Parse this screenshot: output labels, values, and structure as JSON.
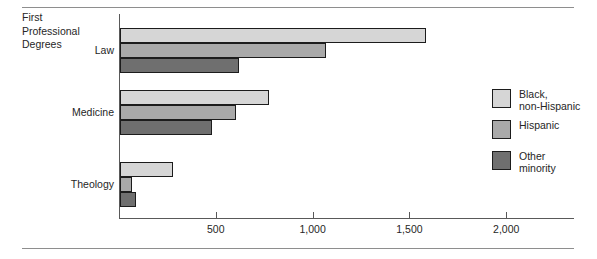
{
  "figure": {
    "block_title": "First\nProfessional\nDegrees",
    "rules": {
      "color": "#8e8e8e"
    }
  },
  "legend": {
    "position": "right",
    "entries": [
      {
        "label": "Black,\nnon-Hispanic",
        "color": "#d6d6d6",
        "name": "black-non-hispanic"
      },
      {
        "label": "Hispanic",
        "color": "#a9a9a9",
        "name": "hispanic"
      },
      {
        "label": "Other\nminority",
        "color": "#6f6f6f",
        "name": "other-minority"
      }
    ]
  },
  "axis": {
    "ticks": [
      {
        "value": 0,
        "label": ""
      },
      {
        "value": 500,
        "label": "500"
      },
      {
        "value": 1000,
        "label": "1,000"
      },
      {
        "value": 1500,
        "label": "1,500"
      },
      {
        "value": 2000,
        "label": "2,000"
      }
    ],
    "min": 0,
    "max": 2350
  },
  "chart_data": {
    "type": "bar",
    "orientation": "horizontal",
    "title": "First Professional Degrees",
    "xlabel": "",
    "ylabel": "",
    "xlim": [
      0,
      2350
    ],
    "grid": false,
    "legend_position": "right",
    "tick_labels": [
      "500",
      "1,000",
      "1,500",
      "2,000"
    ],
    "tick_values": [
      500,
      1000,
      1500,
      2000
    ],
    "categories": [
      "Law",
      "Medicine",
      "Theology"
    ],
    "series": [
      {
        "name": "Black, non-Hispanic",
        "color": "#d6d6d6",
        "values": [
          1580,
          770,
          275
        ]
      },
      {
        "name": "Hispanic",
        "color": "#a9a9a9",
        "values": [
          1065,
          600,
          60
        ]
      },
      {
        "name": "Other minority",
        "color": "#6f6f6f",
        "values": [
          615,
          475,
          85
        ]
      }
    ]
  }
}
